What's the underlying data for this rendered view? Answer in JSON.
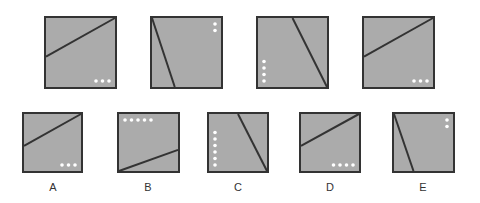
{
  "puzzle": {
    "style": {
      "fill": "#ababab",
      "stroke": "#333333",
      "dot": "#ffffff"
    },
    "sequence": [
      {
        "id": "seq-1",
        "line": "rising-from-left-middle",
        "dots": {
          "count": 3,
          "corner": "bottom-right",
          "direction": "horizontal"
        }
      },
      {
        "id": "seq-2",
        "line": "steep-from-top-left",
        "dots": {
          "count": 2,
          "corner": "top-right",
          "direction": "vertical"
        }
      },
      {
        "id": "seq-3",
        "line": "steep-to-bottom-right",
        "dots": {
          "count": 4,
          "corner": "bottom-left",
          "direction": "vertical"
        }
      },
      {
        "id": "seq-4",
        "line": "rising-from-left-middle",
        "dots": {
          "count": 3,
          "corner": "bottom-right",
          "direction": "horizontal"
        }
      }
    ],
    "options": [
      {
        "label": "A",
        "line": "rising-from-left-middle",
        "dots": {
          "count": 3,
          "corner": "bottom-right",
          "direction": "horizontal"
        }
      },
      {
        "label": "B",
        "line": "rising-from-bottom-left",
        "dots": {
          "count": 5,
          "corner": "top-left",
          "direction": "horizontal"
        }
      },
      {
        "label": "C",
        "line": "steep-to-bottom-right",
        "dots": {
          "count": 6,
          "corner": "bottom-left",
          "direction": "vertical"
        }
      },
      {
        "label": "D",
        "line": "rising-from-left-middle",
        "dots": {
          "count": 4,
          "corner": "bottom-right",
          "direction": "horizontal"
        }
      },
      {
        "label": "E",
        "line": "steep-from-top-left",
        "dots": {
          "count": 2,
          "corner": "top-right",
          "direction": "vertical"
        }
      }
    ]
  }
}
